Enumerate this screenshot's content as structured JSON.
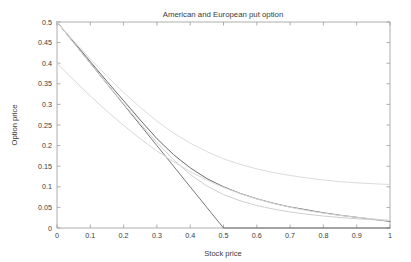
{
  "chart_data": {
    "type": "line",
    "title": "American and European put option",
    "xlabel": "Stock price",
    "ylabel": "Option price",
    "xlim": [
      0,
      1
    ],
    "ylim": [
      0,
      0.5
    ],
    "grid": false,
    "legend": "none",
    "xticks": [
      "0",
      "0.1",
      "0.2",
      "0.3",
      "0.4",
      "0.5",
      "0.6",
      "0.7",
      "0.8",
      "0.9",
      "1"
    ],
    "xtick_values": [
      0,
      0.1,
      0.2,
      0.3,
      0.4,
      0.5,
      0.6,
      0.7,
      0.8,
      0.9,
      1
    ],
    "yticks": [
      "0",
      "0.05",
      "0.1",
      "0.15",
      "0.2",
      "0.25",
      "0.3",
      "0.35",
      "0.4",
      "0.45",
      "0.5"
    ],
    "ytick_values": [
      0,
      0.05,
      0.1,
      0.15,
      0.2,
      0.25,
      0.3,
      0.35,
      0.4,
      0.45,
      0.5
    ],
    "x": [
      0,
      0.05,
      0.1,
      0.15,
      0.2,
      0.25,
      0.3,
      0.35,
      0.4,
      0.45,
      0.5,
      0.55,
      0.6,
      0.65,
      0.7,
      0.75,
      0.8,
      0.85,
      0.9,
      0.95,
      1
    ],
    "series": [
      {
        "name": "Payoff (intrinsic value)",
        "color": "#555555",
        "width": 0.8,
        "values": [
          0.5,
          0.45,
          0.4,
          0.35,
          0.3,
          0.25,
          0.2,
          0.15,
          0.1,
          0.05,
          0,
          0,
          0,
          0,
          0,
          0,
          0,
          0,
          0,
          0,
          0
        ]
      },
      {
        "name": "American put price",
        "color": "#6b6b6b",
        "width": 1.0,
        "values": [
          0.5,
          0.452,
          0.404,
          0.356,
          0.309,
          0.262,
          0.217,
          0.178,
          0.146,
          0.12,
          0.1,
          0.084,
          0.071,
          0.06,
          0.051,
          0.044,
          0.037,
          0.031,
          0.026,
          0.021,
          0.016
        ]
      },
      {
        "name": "European put price",
        "color": "#cfcfcf",
        "width": 1.0,
        "values": [
          0.5,
          0.45,
          0.4,
          0.3505,
          0.3015,
          0.2535,
          0.2075,
          0.1655,
          0.13,
          0.102,
          0.081,
          0.066,
          0.0545,
          0.046,
          0.039,
          0.0335,
          0.029,
          0.0255,
          0.0225,
          0.02,
          0.018
        ]
      },
      {
        "name": "American put (long maturity)",
        "color": "#dcdcdc",
        "width": 1.0,
        "values": [
          0.5,
          0.4545,
          0.4105,
          0.3685,
          0.329,
          0.2925,
          0.2595,
          0.2305,
          0.206,
          0.1855,
          0.168,
          0.1545,
          0.1435,
          0.1345,
          0.1275,
          0.1215,
          0.1165,
          0.1125,
          0.1095,
          0.1075,
          0.1055
        ]
      },
      {
        "name": "European put (short maturity)",
        "color": "#d8d8d8",
        "width": 1.0,
        "values": [
          0.4,
          0.3595,
          0.3205,
          0.2835,
          0.249,
          0.2165,
          0.187,
          0.1605,
          0.137,
          0.1165,
          0.0985,
          0.0835,
          0.0705,
          0.0595,
          0.0505,
          0.0425,
          0.036,
          0.0305,
          0.026,
          0.022,
          0.0185
        ]
      }
    ]
  }
}
